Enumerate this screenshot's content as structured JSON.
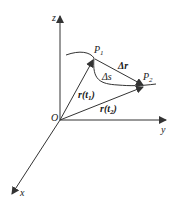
{
  "diagram": {
    "type": "vector-kinematics",
    "axes": {
      "z": "z",
      "y": "y",
      "x": "x",
      "origin": "O"
    },
    "points": {
      "p1": {
        "main": "P",
        "sub": "1"
      },
      "p2": {
        "main": "P",
        "sub": "2"
      }
    },
    "labels": {
      "delta_r": "Δr",
      "delta_s": "Δs",
      "r_t1": "r(t",
      "r_t1_sub": "1",
      "r_t1_close": ")",
      "r_t2": "r(t",
      "r_t2_sub": "2",
      "r_t2_close": ")"
    },
    "colors": {
      "line": "#333333",
      "background": "#ffffff"
    }
  }
}
